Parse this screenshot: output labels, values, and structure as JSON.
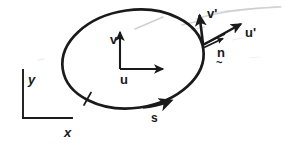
{
  "figure": {
    "background_color": "#ffffff",
    "ink_color": "#1a1a1a",
    "faint_color": "#c9c9c9",
    "width": 284,
    "height": 145
  },
  "labels": {
    "curve": "s",
    "local_u": "u",
    "local_v": "v",
    "global_x": "x",
    "global_y": "y",
    "tangent_u_prime": "u'",
    "tangent_v_prime": "v'",
    "normal_n": "n",
    "normal_n_underline": "~"
  },
  "diagram_data": {
    "type": "diagram",
    "elements": [
      {
        "name": "closed-curve",
        "shape": "ellipse",
        "center": [
          133,
          59
        ],
        "radii": [
          71,
          49
        ],
        "rotation_deg": -8,
        "stroke_width": 2.6,
        "label": "s",
        "direction_marker": "arrowhead at lower-right, clockwise sense",
        "tick_marker": "short slash crossing curve at lower-left"
      },
      {
        "name": "local-axes",
        "origin": [
          120,
          69
        ],
        "axes": [
          {
            "label": "u",
            "direction": "right",
            "length": 48,
            "arrow": true
          },
          {
            "label": "v",
            "direction": "up",
            "length": 39,
            "arrow": true
          }
        ]
      },
      {
        "name": "global-axes",
        "origin": [
          23,
          118
        ],
        "axes": [
          {
            "label": "x",
            "direction": "right",
            "length": 52,
            "arrow": false
          },
          {
            "label": "y",
            "direction": "up",
            "length": 48,
            "arrow": false
          }
        ]
      },
      {
        "name": "boundary-frame",
        "attachment_point": [
          203,
          44
        ],
        "vectors": [
          {
            "label": "v'",
            "tip": [
              200,
              12
            ],
            "arrow": true,
            "note": "tangent-normal frame axis"
          },
          {
            "label": "u'",
            "tip": [
              243,
              22
            ],
            "arrow": true,
            "note": "tangent-normal frame axis"
          },
          {
            "label": "n",
            "tip": [
              228,
              34
            ],
            "arrow": true,
            "note": "outward unit normal, double shaft"
          }
        ]
      },
      {
        "name": "faint-guide-strokes",
        "note": "light grey scan artifacts / faint tangent guide above the curve"
      }
    ]
  }
}
